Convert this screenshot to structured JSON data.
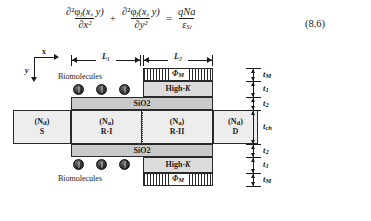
{
  "equation": {
    "number": "(8.6)",
    "term1": {
      "numerator": "∂²φ",
      "numerator_sub": "j",
      "numerator_arg": "(x, y)",
      "denominator": "∂x²"
    },
    "operator_plus": "+",
    "term2": {
      "numerator": "∂²φ",
      "numerator_sub": "j",
      "numerator_arg": "(x, y)",
      "denominator": "∂y²"
    },
    "operator_equals": "=",
    "rhs": {
      "numerator": "qNa",
      "denominator": "ε",
      "denominator_sub": "Si"
    }
  },
  "diagram": {
    "axes": {
      "x_label": "x",
      "y_label": "y"
    },
    "dimensions": {
      "horizontal": [
        {
          "name": "L1",
          "label": "L₁"
        },
        {
          "name": "L2",
          "label": "L₂"
        }
      ],
      "vertical": [
        {
          "name": "tM-top",
          "label": "t",
          "sub": "M"
        },
        {
          "name": "t1-top",
          "label": "t",
          "sub": "1"
        },
        {
          "name": "t2-top",
          "label": "t",
          "sub": "2"
        },
        {
          "name": "tch",
          "label": "t",
          "sub": "ch"
        },
        {
          "name": "t2-bottom",
          "label": "t",
          "sub": "2"
        },
        {
          "name": "t1-bottom",
          "label": "t",
          "sub": "1"
        },
        {
          "name": "tM-bottom",
          "label": "t",
          "sub": "M"
        }
      ]
    },
    "layers": {
      "gate_metal_top": {
        "label": "Φ",
        "sub": "M"
      },
      "high_k_top": {
        "label": "High-",
        "ital": "K"
      },
      "oxide_top": "SiO2",
      "oxide_bottom": "SiO2",
      "high_k_bottom": {
        "label": "High-",
        "ital": "K"
      },
      "gate_metal_bottom": {
        "label": "Φ",
        "sub": "M"
      }
    },
    "regions": [
      {
        "name": "source",
        "doping": "(N",
        "doping_sub": "d",
        "doping_close": ")",
        "label": "S"
      },
      {
        "name": "region-1",
        "doping": "(N",
        "doping_sub": "a",
        "doping_close": ")",
        "label": "R-I"
      },
      {
        "name": "region-2",
        "doping": "(N",
        "doping_sub": "a",
        "doping_close": ")",
        "label": "R-II"
      },
      {
        "name": "drain",
        "doping": "(N",
        "doping_sub": "d",
        "doping_close": ")",
        "label": "D"
      }
    ],
    "biomolecules": {
      "label_top": "Biomolecules",
      "label_bottom": "Biomolecules",
      "count_top": 3,
      "count_bottom": 3
    }
  },
  "colors": {
    "oxide": "#c9c9c9",
    "high_k": "#dcdcdc",
    "silicon": "#ededed",
    "metal_hatch": "#2a2a2a",
    "outline": "#2a2a2a",
    "biomolecule": "#161616"
  }
}
